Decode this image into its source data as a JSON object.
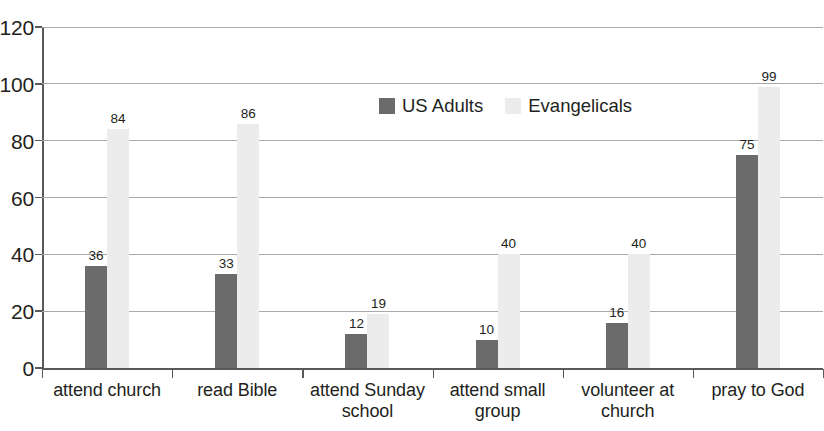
{
  "chart_data": {
    "type": "bar",
    "title": "",
    "title_cropped": true,
    "xlabel": "",
    "ylabel": "",
    "ylim": [
      0,
      120
    ],
    "ytick_step": 20,
    "yticks": [
      0,
      20,
      40,
      60,
      80,
      100,
      120
    ],
    "ytick_labels": [
      "0",
      "20",
      "40",
      "60",
      "80",
      "100",
      "120"
    ],
    "grid": "horizontal",
    "legend_position": "inside-top-center",
    "categories": [
      "attend church",
      "read Bible",
      "attend Sunday school",
      "attend small group",
      "volunteer at church",
      "pray to God"
    ],
    "category_lines": [
      [
        "attend church"
      ],
      [
        "read Bible"
      ],
      [
        "attend Sunday",
        "school"
      ],
      [
        "attend small",
        "group"
      ],
      [
        "volunteer at",
        "church"
      ],
      [
        "pray to God"
      ]
    ],
    "series": [
      {
        "name": "US Adults",
        "color": "#6b6b6b",
        "values": [
          36,
          33,
          12,
          10,
          16,
          75
        ],
        "value_labels": [
          "36",
          "33",
          "12",
          "10",
          "16",
          "75"
        ]
      },
      {
        "name": "Evangelicals",
        "color": "#ececec",
        "values": [
          84,
          86,
          19,
          40,
          40,
          99
        ],
        "value_labels": [
          "84",
          "86",
          "19",
          "40",
          "40",
          "99"
        ]
      }
    ]
  },
  "legend": {
    "items": [
      {
        "label": "US Adults",
        "color": "#6b6b6b"
      },
      {
        "label": "Evangelicals",
        "color": "#ececec"
      }
    ]
  },
  "colors": {
    "us_adults": "#6b6b6b",
    "evangelicals": "#ececec",
    "gridline": "#a7a9ac",
    "axis": "#58595b",
    "text": "#231f20",
    "background": "#ffffff"
  }
}
